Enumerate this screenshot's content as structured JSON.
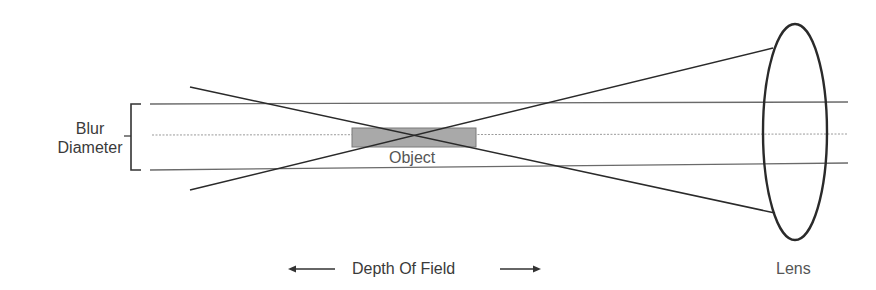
{
  "diagram": {
    "labels": {
      "blur_line1": "Blur",
      "blur_line2": "Diameter",
      "object": "Object",
      "depth_of_field": "Depth Of Field",
      "lens": "Lens"
    },
    "elements": {
      "horizontal_rays": 3,
      "converging_rays": 2,
      "lens_shape": "biconvex-ellipse",
      "object_shape": "gray-rectangle"
    },
    "colors": {
      "line": "#2a2a2a",
      "guide": "#888888",
      "object_fill": "#a9a9a9",
      "object_stroke": "#777777",
      "text": "#3a3a3a"
    }
  }
}
